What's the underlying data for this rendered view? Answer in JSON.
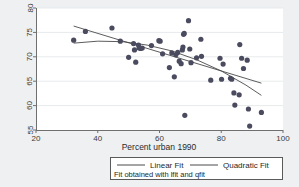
{
  "chart_data": {
    "type": "scatter",
    "title": "",
    "xlabel": "Percent urban 1990",
    "ylabel": "",
    "xlim": [
      20,
      100
    ],
    "ylim": [
      55,
      80
    ],
    "xticks": [
      20,
      40,
      60,
      80,
      100
    ],
    "yticks": [
      55,
      60,
      65,
      70,
      75,
      80
    ],
    "xtick_labels": [
      "20",
      "40",
      "60",
      "80",
      "100"
    ],
    "ytick_labels": [
      "55",
      "60",
      "65",
      "70",
      "75",
      "80"
    ],
    "grid": "horizontal",
    "legend_position": "below-plot",
    "marker_color": "#4b4b60",
    "line_color": "#4a4a4a",
    "plot_background": "#ffffff",
    "figure_background": "#eef0f1",
    "points": [
      {
        "x": 32.2,
        "y": 73.4
      },
      {
        "x": 36.0,
        "y": 75.2
      },
      {
        "x": 44.6,
        "y": 75.9
      },
      {
        "x": 47.3,
        "y": 73.2
      },
      {
        "x": 50.0,
        "y": 69.9
      },
      {
        "x": 51.6,
        "y": 72.7
      },
      {
        "x": 51.9,
        "y": 71.4
      },
      {
        "x": 52.3,
        "y": 68.9
      },
      {
        "x": 53.2,
        "y": 72.4
      },
      {
        "x": 53.4,
        "y": 71.8
      },
      {
        "x": 53.9,
        "y": 71.7
      },
      {
        "x": 54.4,
        "y": 71.8
      },
      {
        "x": 57.4,
        "y": 72.3
      },
      {
        "x": 59.8,
        "y": 73.3
      },
      {
        "x": 60.2,
        "y": 73.2
      },
      {
        "x": 61.0,
        "y": 70.6
      },
      {
        "x": 63.2,
        "y": 67.8
      },
      {
        "x": 64.0,
        "y": 70.8
      },
      {
        "x": 64.8,
        "y": 65.9
      },
      {
        "x": 65.3,
        "y": 70.4
      },
      {
        "x": 65.9,
        "y": 70.9
      },
      {
        "x": 66.4,
        "y": 69.1
      },
      {
        "x": 67.0,
        "y": 68.6
      },
      {
        "x": 67.4,
        "y": 71.4
      },
      {
        "x": 67.6,
        "y": 72.0
      },
      {
        "x": 67.8,
        "y": 74.6
      },
      {
        "x": 68.0,
        "y": 74.8
      },
      {
        "x": 68.2,
        "y": 58.0
      },
      {
        "x": 69.4,
        "y": 77.4
      },
      {
        "x": 69.8,
        "y": 71.6
      },
      {
        "x": 70.2,
        "y": 68.8
      },
      {
        "x": 72.0,
        "y": 69.8
      },
      {
        "x": 73.4,
        "y": 73.6
      },
      {
        "x": 73.6,
        "y": 70.1
      },
      {
        "x": 76.6,
        "y": 65.2
      },
      {
        "x": 79.6,
        "y": 69.7
      },
      {
        "x": 80.1,
        "y": 65.4
      },
      {
        "x": 80.6,
        "y": 68.5
      },
      {
        "x": 83.0,
        "y": 65.6
      },
      {
        "x": 83.4,
        "y": 65.4
      },
      {
        "x": 84.1,
        "y": 62.6
      },
      {
        "x": 84.4,
        "y": 60.1
      },
      {
        "x": 85.8,
        "y": 62.2
      },
      {
        "x": 86.0,
        "y": 72.5
      },
      {
        "x": 86.6,
        "y": 69.7
      },
      {
        "x": 87.2,
        "y": 67.6
      },
      {
        "x": 88.4,
        "y": 69.3
      },
      {
        "x": 88.8,
        "y": 59.3
      },
      {
        "x": 89.2,
        "y": 55.8
      },
      {
        "x": 93.0,
        "y": 58.6
      }
    ],
    "linear_fit": {
      "name": "Linear Fit",
      "x_start": 32.2,
      "x_end": 93.0,
      "y_start": 76.3,
      "y_end": 64.6
    },
    "quadratic_fit": {
      "name": "Quadratic Fit",
      "x_start": 32.2,
      "x_end": 93.0,
      "coeffs_note": "downward-curving",
      "samples": [
        {
          "x": 32.2,
          "y": 72.8
        },
        {
          "x": 40.0,
          "y": 73.2
        },
        {
          "x": 48.0,
          "y": 73.1
        },
        {
          "x": 56.0,
          "y": 72.4
        },
        {
          "x": 64.0,
          "y": 71.2
        },
        {
          "x": 72.0,
          "y": 69.4
        },
        {
          "x": 80.0,
          "y": 67.1
        },
        {
          "x": 88.0,
          "y": 64.2
        },
        {
          "x": 93.0,
          "y": 62.1
        }
      ]
    }
  },
  "legend": {
    "entries": [
      {
        "label": "Linear Fit"
      },
      {
        "label": "Quadratic Fit"
      }
    ],
    "note": "Fit obtained with lfit and qfit"
  }
}
